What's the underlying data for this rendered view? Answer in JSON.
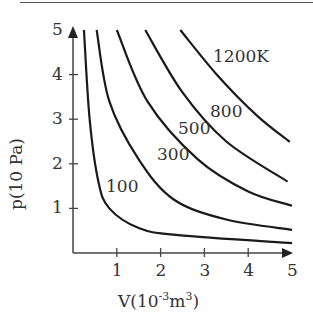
{
  "chart_data": {
    "type": "line",
    "title": "",
    "xlabel": "V(10^-3 m^3)",
    "ylabel": "p(10 Pa)",
    "xlim": [
      0,
      5
    ],
    "ylim": [
      0,
      5
    ],
    "xticks": [
      "1",
      "2",
      "3",
      "4",
      "5"
    ],
    "yticks": [
      "1",
      "2",
      "3",
      "4",
      "5"
    ],
    "grid": false,
    "legend": "inline curve labels",
    "series": [
      {
        "name": "100",
        "label": "100",
        "points": [
          [
            0.25,
            5
          ],
          [
            0.38,
            3
          ],
          [
            0.58,
            1.6
          ],
          [
            0.83,
            1.0
          ],
          [
            1.5,
            0.56
          ],
          [
            2.4,
            0.4
          ],
          [
            5,
            0.22
          ]
        ]
      },
      {
        "name": "300",
        "label": "300",
        "points": [
          [
            0.54,
            5
          ],
          [
            0.83,
            3.4
          ],
          [
            1.5,
            2.1
          ],
          [
            2.3,
            1.2
          ],
          [
            3.5,
            0.75
          ],
          [
            5,
            0.52
          ]
        ]
      },
      {
        "name": "500",
        "label": "500",
        "points": [
          [
            1.0,
            5
          ],
          [
            1.7,
            3.4
          ],
          [
            2.85,
            2.1
          ],
          [
            4.0,
            1.38
          ],
          [
            5,
            1.06
          ]
        ]
      },
      {
        "name": "800",
        "label": "800",
        "points": [
          [
            1.65,
            5
          ],
          [
            2.5,
            3.6
          ],
          [
            3.5,
            2.5
          ],
          [
            4.9,
            1.6
          ]
        ]
      },
      {
        "name": "1200K",
        "label": "1200K",
        "points": [
          [
            2.45,
            5
          ],
          [
            3.3,
            3.98
          ],
          [
            4.2,
            3.08
          ],
          [
            4.95,
            2.49
          ]
        ]
      }
    ]
  },
  "labels": {
    "ylabel_text": "p(10 Pa)",
    "xlabel_prefix": "V(10",
    "xlabel_exp": "-3",
    "xlabel_unit": "m",
    "xlabel_unit_exp": "3",
    "xlabel_close": ")",
    "curve_labels": [
      "100",
      "300",
      "500",
      "800",
      "1200K"
    ]
  }
}
